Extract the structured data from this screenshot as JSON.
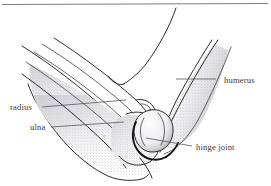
{
  "figure": {
    "style": "pen-and-ink line drawing with stipple shading",
    "background_color": "#ffffff",
    "ink_color": "#2b2b30",
    "label_color": "#3a3a3a",
    "top_rule": true,
    "labels": [
      {
        "id": "humerus",
        "text": "humerus",
        "text_x": 224,
        "text_y": 83,
        "anchor": "start",
        "leader": "M 216 79 L 176 79",
        "leader_target": "upper arm bone shaft"
      },
      {
        "id": "radius",
        "text": "radius",
        "text_x": 10,
        "text_y": 110,
        "anchor": "start",
        "leader": "M 42 107 L 126 100",
        "leader_target": "upper forearm bone"
      },
      {
        "id": "ulna",
        "text": "ulna",
        "text_x": 30,
        "text_y": 130,
        "anchor": "start",
        "leader": "M 51 127 L 124 122",
        "leader_target": "lower forearm bone"
      },
      {
        "id": "hinge-joint",
        "text": "hinge joint",
        "text_x": 196,
        "text_y": 150,
        "anchor": "start",
        "leader": "M 192 146 L 146 138",
        "leader_target": "articulation between humerus and ulna"
      }
    ]
  }
}
